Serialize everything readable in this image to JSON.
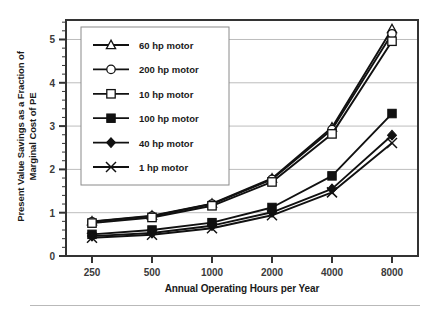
{
  "chart_data": {
    "type": "line",
    "title": "",
    "xlabel": "Annual Operating Hours per Year",
    "ylabel": "Present Value Savings as a Fraction of\nMarginal Cost of PE",
    "categories": [
      "250",
      "500",
      "1000",
      "2000",
      "4000",
      "8000"
    ],
    "x_tick_labels": [
      "250",
      "500",
      "1000",
      "2000",
      "4000",
      "8000"
    ],
    "y_tick_labels": [
      "0",
      "1",
      "2",
      "3",
      "4",
      "5"
    ],
    "ylim": [
      0,
      5.45
    ],
    "y_major_ticks": [
      0,
      1,
      2,
      3,
      4,
      5
    ],
    "y_minor_tick_step": 0.2,
    "grid": "horizontal",
    "legend_position": "upper-left-inside",
    "line_color": "#111111",
    "grid_color": "#bdbdbd",
    "axis_color": "#333333",
    "background": "#ffffff",
    "series": [
      {
        "name": "60 hp motor",
        "marker": "open-triangle",
        "values": [
          0.8,
          0.93,
          1.21,
          1.79,
          2.97,
          5.24
        ]
      },
      {
        "name": "200 hp motor",
        "marker": "open-circle",
        "values": [
          0.79,
          0.92,
          1.2,
          1.77,
          2.92,
          5.13
        ]
      },
      {
        "name": "10 hp motor",
        "marker": "open-square",
        "values": [
          0.76,
          0.89,
          1.16,
          1.71,
          2.82,
          4.96
        ]
      },
      {
        "name": "100 hp motor",
        "marker": "filled-square",
        "values": [
          0.5,
          0.6,
          0.77,
          1.12,
          1.85,
          3.29
        ]
      },
      {
        "name": "40 hp motor",
        "marker": "filled-diamond",
        "values": [
          0.46,
          0.53,
          0.7,
          1.01,
          1.55,
          2.79
        ]
      },
      {
        "name": "1 hp motor",
        "marker": "x-cross",
        "values": [
          0.42,
          0.49,
          0.64,
          0.94,
          1.47,
          2.61
        ]
      }
    ]
  },
  "legend": {
    "items": [
      {
        "label": "60 hp motor",
        "marker": "open-triangle"
      },
      {
        "label": "200 hp motor",
        "marker": "open-circle"
      },
      {
        "label": "10 hp motor",
        "marker": "open-square"
      },
      {
        "label": "100 hp motor",
        "marker": "filled-square"
      },
      {
        "label": "40 hp motor",
        "marker": "filled-diamond"
      },
      {
        "label": "1 hp motor",
        "marker": "x-cross"
      }
    ]
  }
}
